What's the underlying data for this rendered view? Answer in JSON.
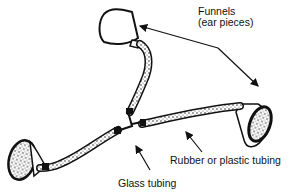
{
  "diagram": {
    "labels": {
      "funnels_line1": "Funnels",
      "funnels_line2": "(ear pieces)",
      "rubber_tubing": "Rubber or plastic tubing",
      "glass_tubing": "Glass tubing"
    },
    "colors": {
      "ink": "#111111",
      "background": "#ffffff",
      "stipple": "#555555"
    }
  }
}
